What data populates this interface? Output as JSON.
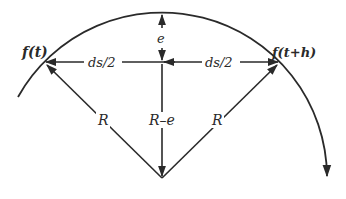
{
  "diagram": {
    "type": "geometry-arc-chord",
    "labels": {
      "left_point": "f(t)",
      "right_point": "f(t+h)",
      "half_chord_left": "ds/2",
      "half_chord_right": "ds/2",
      "sagitta": "e",
      "radius_left": "R",
      "radius_center": "R–e",
      "radius_right": "R"
    },
    "colors": {
      "stroke": "#2a2a2a",
      "background": "#ffffff"
    }
  }
}
